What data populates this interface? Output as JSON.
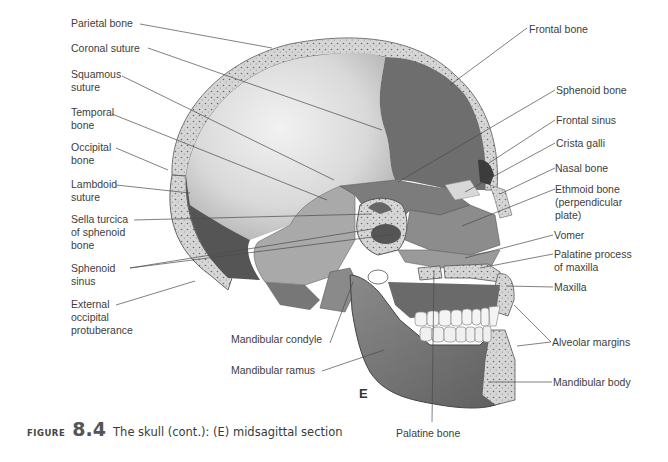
{
  "figure": {
    "panel_letter": "E",
    "caption_prefix": "FIGURE",
    "caption_number": "8.4",
    "caption_text": "The skull (cont.): (E) midsagittal section"
  },
  "labels_left": [
    {
      "id": "parietal-bone",
      "text": "Parietal bone"
    },
    {
      "id": "coronal-suture",
      "text": "Coronal suture"
    },
    {
      "id": "squamous-suture",
      "text": "Squamous\nsuture"
    },
    {
      "id": "temporal-bone",
      "text": "Temporal\nbone"
    },
    {
      "id": "occipital-bone",
      "text": "Occipital\nbone"
    },
    {
      "id": "lambdoid-suture",
      "text": "Lambdoid\nsuture"
    },
    {
      "id": "sella-turcica",
      "text": "Sella turcica\nof sphenoid\nbone"
    },
    {
      "id": "sphenoid-sinus",
      "text": "Sphenoid\nsinus"
    },
    {
      "id": "external-occipital-protuberance",
      "text": "External\noccipital\nprotuberance"
    }
  ],
  "labels_right": [
    {
      "id": "frontal-bone",
      "text": "Frontal bone"
    },
    {
      "id": "sphenoid-bone",
      "text": "Sphenoid bone"
    },
    {
      "id": "frontal-sinus",
      "text": "Frontal sinus"
    },
    {
      "id": "crista-galli",
      "text": "Crista galli"
    },
    {
      "id": "nasal-bone",
      "text": "Nasal bone"
    },
    {
      "id": "ethmoid-bone",
      "text": "Ethmoid bone\n(perpendicular\nplate)"
    },
    {
      "id": "vomer",
      "text": "Vomer"
    },
    {
      "id": "palatine-process",
      "text": "Palatine process\nof maxilla"
    },
    {
      "id": "maxilla",
      "text": "Maxilla"
    },
    {
      "id": "alveolar-margins",
      "text": "Alveolar margins"
    },
    {
      "id": "mandibular-body",
      "text": "Mandibular body"
    }
  ],
  "labels_bottom": [
    {
      "id": "mandibular-condyle",
      "text": "Mandibular condyle"
    },
    {
      "id": "mandibular-ramus",
      "text": "Mandibular ramus"
    },
    {
      "id": "palatine-bone",
      "text": "Palatine bone"
    }
  ]
}
